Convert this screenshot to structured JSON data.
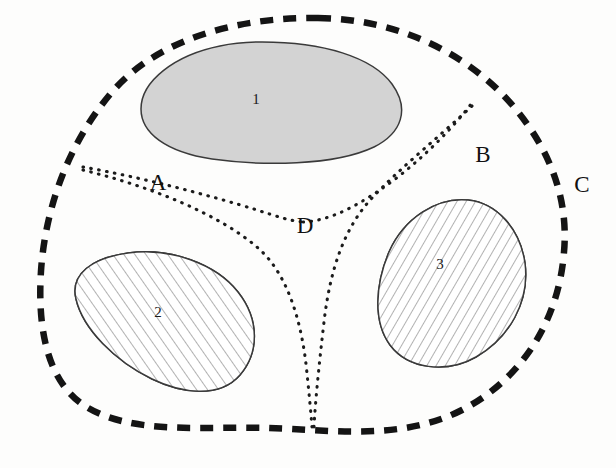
{
  "figure": {
    "background_color": "#fdfdfc",
    "width": 616,
    "height": 468
  },
  "style_colors": {
    "outer_boundary_stroke": "#141414",
    "divider_stroke": "#1b1b1b",
    "blob_outline_stroke": "#3a3a3a",
    "shaded_fill": "#d3d3d3",
    "hatch_stroke": "#555555",
    "label_color": "#111111"
  },
  "outer_boundary": {
    "name": "outer-dashed-boundary",
    "line_style": "dashed",
    "path": "M 318 18 C 400 19 470 55 514 107 C 556 157 568 207 564 252 C 559 318 524 378 462 410 C 402 441 330 430 268 428 C 205 426 128 436 82 404 C 43 376 38 318 41 271 C 45 212 66 146 112 92 C 162 34 248 17 318 18 Z"
  },
  "regions": [
    {
      "id": "region-1",
      "label": "1",
      "fill_style": "solid-gray",
      "label_position": {
        "x": 256,
        "y": 101
      },
      "path": "M 262 42 C 323 42 372 57 392 84 C 410 109 402 133 374 147 C 334 166 262 166 212 159 C 166 152 141 133 141 109 C 141 81 175 55 220 46 C 234 43 248 42 262 42 Z"
    },
    {
      "id": "region-2",
      "label": "2",
      "fill_style": "hatched-up",
      "label_position": {
        "x": 158,
        "y": 314
      },
      "path": "M 128 253 C 170 247 216 264 238 292 C 260 320 259 353 240 375 C 219 399 181 393 152 379 C 115 361 83 329 76 299 C 70 274 92 258 128 253 Z"
    },
    {
      "id": "region-3",
      "label": "3",
      "fill_style": "hatched-down",
      "label_position": {
        "x": 440,
        "y": 266
      },
      "path": "M 468 200 C 497 203 520 229 525 263 C 530 302 509 338 476 357 C 446 374 408 369 390 345 C 373 322 375 285 389 252 C 404 218 437 197 468 200 Z"
    }
  ],
  "dividers": [
    {
      "id": "divider-upper-left",
      "from": "boundary-west",
      "to": "junction-d",
      "path": "M 83 167 C 140 177 212 196 257 210 C 276 216 290 221 303 222"
    },
    {
      "id": "divider-upper-right",
      "from": "junction-d",
      "to": "boundary-northeast",
      "path": "M 303 222 C 330 221 360 205 394 180 C 428 154 456 124 471 104"
    },
    {
      "id": "divider-lower-left",
      "from": "boundary-west",
      "to": "junction-bottom",
      "path": "M 83 170 C 148 186 218 213 258 248 C 288 274 301 322 306 364 C 309 392 311 414 312 427"
    },
    {
      "id": "divider-lower-right",
      "from": "boundary-northeast",
      "to": "junction-bottom",
      "path": "M 472 106 C 440 136 400 168 372 198 C 344 228 330 270 324 322 C 319 365 315 405 314 427"
    }
  ],
  "zone_labels": [
    {
      "id": "zone-a",
      "text": "A",
      "x": 158,
      "y": 185
    },
    {
      "id": "zone-b",
      "text": "B",
      "x": 483,
      "y": 157
    },
    {
      "id": "zone-c",
      "text": "C",
      "x": 582,
      "y": 187
    },
    {
      "id": "zone-d",
      "text": "D",
      "x": 305,
      "y": 228
    }
  ]
}
